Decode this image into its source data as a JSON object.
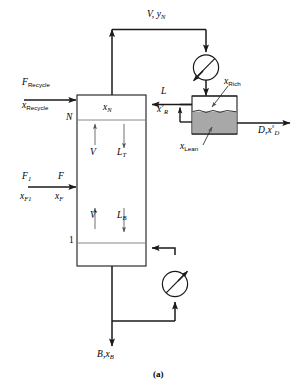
{
  "figure": {
    "caption": "(a)",
    "type": "process-flow-diagram"
  },
  "colors": {
    "line": "#1a1a1a",
    "lean_phase_fill": "#a8a8a8",
    "rich_phase_fill": "#ffffff",
    "background": "#ffffff"
  },
  "streams": {
    "overhead_vapor": {
      "flow": "V",
      "composition": "y",
      "composition_sub": "N"
    },
    "recycle_feed": {
      "flow": "F",
      "flow_sub": "Recycle",
      "composition": "x",
      "composition_sub": "Recycle"
    },
    "fresh_feed_source": {
      "flow": "F",
      "flow_sub": "1",
      "composition": "x",
      "composition_sub": "F1"
    },
    "column_feed": {
      "flow": "F",
      "composition": "x",
      "composition_sub": "F"
    },
    "reflux": {
      "flow": "L",
      "composition": "x",
      "composition_sup": "°",
      "composition_sub": "R"
    },
    "distillate": {
      "flow": "D",
      "composition": "x",
      "composition_sup": "°",
      "composition_sub": "D"
    },
    "bottoms": {
      "flow": "B",
      "composition": "x",
      "composition_sub": "B"
    },
    "internal_vapor_top": {
      "flow": "V"
    },
    "internal_vapor_bottom": {
      "flow": "V"
    },
    "internal_liquid_top": {
      "flow": "L",
      "flow_sub": "T"
    },
    "internal_liquid_bottom": {
      "flow": "L",
      "flow_sub": "B"
    }
  },
  "column": {
    "top_stage_label": "N",
    "bottom_stage_label": "1",
    "top_stage_composition": {
      "symbol": "x",
      "sub": "N"
    }
  },
  "decanter": {
    "upper_phase_label": {
      "symbol": "x",
      "sub": "Rich"
    },
    "lower_phase_label": {
      "symbol": "x",
      "sub": "Lean"
    }
  },
  "equipment": {
    "condenser": {
      "name": "condenser",
      "symbol": "circle-with-slash"
    },
    "reboiler": {
      "name": "reboiler",
      "symbol": "circle-with-slash"
    },
    "decanter": {
      "name": "decanter",
      "symbol": "two-phase-vessel"
    },
    "column": {
      "name": "distillation-column",
      "symbol": "rectangular-column"
    }
  }
}
